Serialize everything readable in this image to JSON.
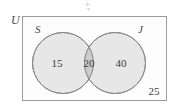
{
  "figure": {
    "type": "venn-diagram",
    "universe_label": "U",
    "sets": [
      {
        "id": "S",
        "label": "S",
        "only_count": "15"
      },
      {
        "id": "J",
        "label": "J",
        "only_count": "40"
      }
    ],
    "intersection_count": "20",
    "outside_count": "25",
    "colors": {
      "circle_fill": "#e7e7e7",
      "intersection_fill": "#cccccc",
      "circle_stroke": "#8a8a8a",
      "rect_stroke": "#9a9a9a",
      "text": "#3d3d3d",
      "background": "#ffffff"
    }
  },
  "chart_data": {
    "type": "venn",
    "title": "",
    "universe": "U",
    "set_labels": [
      "S",
      "J"
    ],
    "regions": [
      {
        "region": "S only",
        "value": 15
      },
      {
        "region": "S and J",
        "value": 20
      },
      {
        "region": "J only",
        "value": 40
      },
      {
        "region": "Neither (U)",
        "value": 25
      }
    ],
    "totals": {
      "S": 35,
      "J": 60,
      "union": 75,
      "universe": 100
    }
  }
}
